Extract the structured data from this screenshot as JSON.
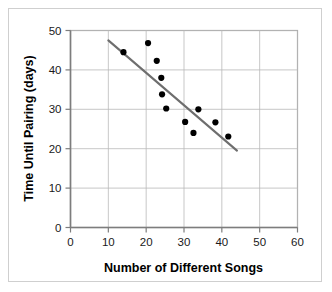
{
  "chart_data": {
    "type": "scatter",
    "title": "",
    "xlabel": "Number of Different Songs",
    "ylabel": "Time Until Pairing (days)",
    "xlim": [
      0,
      60
    ],
    "ylim": [
      0,
      50
    ],
    "xticks": [
      0,
      10,
      20,
      30,
      40,
      50,
      60
    ],
    "yticks": [
      0,
      10,
      20,
      30,
      40,
      50
    ],
    "xtick_labels": [
      "0",
      "10",
      "20",
      "30",
      "40",
      "50",
      "60"
    ],
    "ytick_labels": [
      "0",
      "10",
      "20",
      "30",
      "40",
      "50"
    ],
    "grid": true,
    "legend": null,
    "points": [
      {
        "x": 14.0,
        "y": 44.5
      },
      {
        "x": 20.5,
        "y": 46.8
      },
      {
        "x": 22.8,
        "y": 42.3
      },
      {
        "x": 24.0,
        "y": 38.0
      },
      {
        "x": 24.2,
        "y": 33.8
      },
      {
        "x": 25.3,
        "y": 30.2
      },
      {
        "x": 30.3,
        "y": 26.8
      },
      {
        "x": 32.5,
        "y": 24.0
      },
      {
        "x": 33.8,
        "y": 30.0
      },
      {
        "x": 38.3,
        "y": 26.7
      },
      {
        "x": 41.7,
        "y": 23.1
      }
    ],
    "trend_line": {
      "x1": 10.0,
      "y1": 47.5,
      "x2": 44.0,
      "y2": 19.5,
      "color": "#6e6e6e"
    },
    "colors": {
      "point": "#000000",
      "trend": "#6e6e6e",
      "grid": "#b9b9b9",
      "axis": "#7d7d7d",
      "background": "#ffffff",
      "frame": "#cfcfcf"
    }
  }
}
